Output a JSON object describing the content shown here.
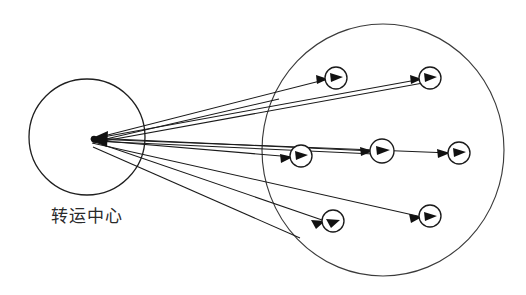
{
  "diagram": {
    "type": "hub-and-spoke routing diagram",
    "canvas": {
      "width": 526,
      "height": 295,
      "background": "#ffffff"
    },
    "stroke_color": "#1a1a1a",
    "region_stroke_color": "#3b3b3b",
    "label_color": "#2a2a2a",
    "hub": {
      "label": "转运中心",
      "label_x": 87,
      "label_y": 222,
      "circle": {
        "cx": 87,
        "cy": 137,
        "r": 58
      },
      "convergence_point": {
        "x": 92,
        "y": 139
      }
    },
    "service_region": {
      "name": "service-area",
      "circle": {
        "cx": 383,
        "cy": 150,
        "rx": 121,
        "ry": 126
      }
    },
    "nodes": [
      {
        "id": "node-1",
        "cx": 336,
        "cy": 78,
        "r": 11,
        "row": "top",
        "order": 1
      },
      {
        "id": "node-2",
        "cx": 430,
        "cy": 78,
        "r": 11,
        "row": "top",
        "order": 2
      },
      {
        "id": "node-3",
        "cx": 301,
        "cy": 156,
        "r": 11,
        "row": "middle",
        "order": 1
      },
      {
        "id": "node-4",
        "cx": 382,
        "cy": 151,
        "r": 12,
        "row": "middle",
        "order": 2
      },
      {
        "id": "node-5",
        "cx": 459,
        "cy": 153,
        "r": 11,
        "row": "middle",
        "order": 3
      },
      {
        "id": "node-6",
        "cx": 333,
        "cy": 221,
        "r": 11,
        "row": "bottom",
        "order": 1
      },
      {
        "id": "node-7",
        "cx": 430,
        "cy": 216,
        "r": 11,
        "row": "bottom",
        "order": 2
      }
    ],
    "routes": [
      {
        "id": "route-to-node-1",
        "from": "hub",
        "to": "node-1",
        "direction": "outbound"
      },
      {
        "id": "route-to-node-2",
        "from": "hub",
        "to": "node-2",
        "direction": "outbound"
      },
      {
        "id": "route-to-node-3",
        "from": "hub",
        "to": "node-3",
        "direction": "outbound"
      },
      {
        "id": "route-to-node-4",
        "from": "hub",
        "to": "node-4",
        "direction": "outbound"
      },
      {
        "id": "route-to-node-5",
        "from": "hub",
        "to": "node-5",
        "direction": "outbound"
      },
      {
        "id": "route-to-node-6",
        "from": "hub",
        "to": "node-6",
        "direction": "outbound"
      },
      {
        "id": "route-to-node-7",
        "from": "hub",
        "to": "node-7",
        "direction": "outbound"
      }
    ],
    "return_arrow": {
      "id": "inbound-arrowhead",
      "x": 92,
      "y": 139,
      "direction": "left"
    }
  }
}
